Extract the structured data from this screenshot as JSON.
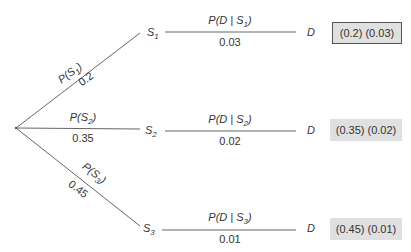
{
  "diagram": {
    "type": "probability-tree",
    "root": "start",
    "branches": [
      {
        "node_label": "S",
        "node_sub": "1",
        "prior_label_pre": "P(S",
        "prior_label_sub": "1",
        "prior_label_post": ")",
        "prior_value": "0.2",
        "cond_label_pre": "P(D | S",
        "cond_label_sub": "1",
        "cond_label_post": ")",
        "cond_value": "0.03",
        "outcome": "D",
        "product": "(0.2) (0.03)"
      },
      {
        "node_label": "S",
        "node_sub": "2",
        "prior_label_pre": "P(S",
        "prior_label_sub": "2",
        "prior_label_post": ")",
        "prior_value": "0.35",
        "cond_label_pre": "P(D | S",
        "cond_label_sub": "2",
        "cond_label_post": ")",
        "cond_value": "0.02",
        "outcome": "D",
        "product": "(0.35) (0.02)"
      },
      {
        "node_label": "S",
        "node_sub": "3",
        "prior_label_pre": "P(S",
        "prior_label_sub": "3",
        "prior_label_post": ")",
        "prior_value": "0.45",
        "cond_label_pre": "P(D | S",
        "cond_label_sub": "3",
        "cond_label_post": ")",
        "cond_value": "0.01",
        "outcome": "D",
        "product": "(0.45) (0.01)"
      }
    ]
  }
}
